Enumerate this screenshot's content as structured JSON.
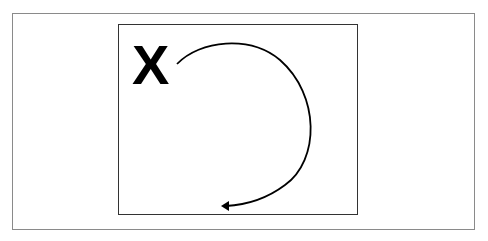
{
  "diagram": {
    "label": "X",
    "arrow": {
      "direction": "clockwise",
      "description": "curved arrow from X around right side, ending bottom-center"
    },
    "colors": {
      "stroke": "#000000",
      "outer_border": "#8a8a8a",
      "inner_border": "#333333",
      "background": "#ffffff"
    }
  }
}
